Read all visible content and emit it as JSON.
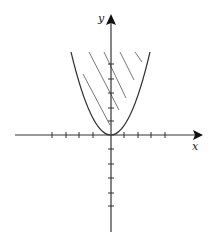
{
  "figure": {
    "axes": {
      "x_label": "x",
      "y_label": "y",
      "origin_px": [
        111,
        135
      ],
      "tick_spacing_px": 14,
      "x_ticks_left": 4,
      "x_ticks_right": 4,
      "y_ticks_up": 5,
      "y_ticks_down": 5
    },
    "curve": {
      "type": "parabola",
      "equation": "y = x^2",
      "vertex": [
        0,
        0
      ],
      "opens": "up"
    },
    "shading": {
      "type": "hatch",
      "region": "inside parabola (above curve)"
    },
    "colors": {
      "line": "#333333",
      "hatch": "#666666",
      "background": "#ffffff"
    }
  }
}
